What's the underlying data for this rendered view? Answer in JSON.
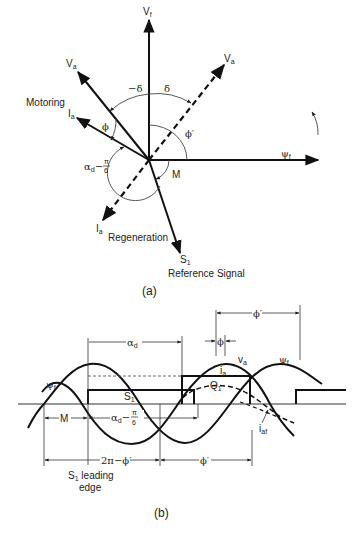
{
  "figure": {
    "panel_a": {
      "caption": "(a)",
      "phasors": {
        "vf": "V",
        "vf_sub": "f",
        "va_motoring": "V",
        "va_motoring_sub": "a",
        "va_regen": "V",
        "va_regen_sub": "a",
        "ia_motoring": "I",
        "ia_motoring_sub": "a",
        "ia_regen": "I",
        "ia_regen_sub": "a",
        "psi_f": "ψ",
        "psi_f_sub": "f",
        "s1": "S",
        "s1_sub": "1"
      },
      "angles": {
        "minus_delta": "−δ",
        "delta": "δ",
        "phi": "ϕ",
        "phi_prime": "ϕ′",
        "m": "M",
        "alpha_d": "α",
        "alpha_d_sub": "d",
        "alpha_minus": "−",
        "pi": "π",
        "six": "6"
      },
      "labels": {
        "motoring": "Motoring",
        "regeneration": "Regeneration",
        "reference_signal": "Reference Signal"
      }
    },
    "panel_b": {
      "caption": "(b)",
      "labels": {
        "phi_prime_top": "ϕ′",
        "phi": "ϕ",
        "alpha_d": "α",
        "alpha_d_sub": "d",
        "va": "v",
        "va_sub": "a",
        "psi_f_right": "ψ",
        "psi_f_right_sub": "f",
        "psi_f_left": "ψ",
        "psi_f_left_sub": "f",
        "ia": "i",
        "ia_sub": "a",
        "q1": "Q",
        "q1_sub": "1",
        "s1": "S",
        "s1_sub": "1",
        "m": "M",
        "alpha_expr": "α",
        "alpha_expr_sub": "d",
        "alpha_minus": "−",
        "pi": "π",
        "six": "6",
        "iaf": "i",
        "iaf_sub": "af",
        "two_pi_minus_phi": "2π−ϕ′",
        "phi_prime_bottom": "ϕ′",
        "s1_leading_edge_line1": "S",
        "s1_leading_edge_sub": "1",
        "s1_leading_edge_line1_rest": " leading",
        "s1_leading_edge_line2": "edge"
      }
    }
  },
  "colors": {
    "stroke": "#111111",
    "dashed": "#111111",
    "thin": "#444444",
    "background": "#ffffff"
  }
}
